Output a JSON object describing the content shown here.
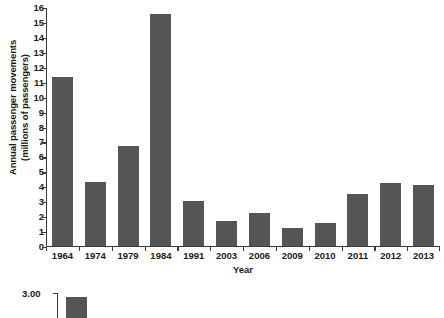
{
  "chart_data": {
    "type": "bar",
    "title": "",
    "xlabel": "Year",
    "ylabel": "Annual passenger movements\n(millions of passengers)",
    "categories": [
      "1964",
      "1974",
      "1979",
      "1984",
      "1991",
      "2003",
      "2006",
      "2009",
      "2010",
      "2011",
      "2012",
      "2013"
    ],
    "values": [
      11.3,
      4.3,
      6.7,
      15.5,
      3.0,
      1.65,
      2.2,
      1.2,
      1.5,
      3.5,
      4.2,
      4.1
    ],
    "ylim": [
      0,
      16
    ],
    "ytick_values": [
      0,
      1,
      2,
      3,
      4,
      5,
      6,
      7,
      8,
      9,
      10,
      11,
      12,
      13,
      14,
      15,
      16
    ],
    "ytick_labels": [
      "0",
      "1",
      "2",
      "3",
      "4",
      "5",
      "6",
      "7",
      "8",
      "9",
      "10",
      "11",
      "12",
      "13",
      "14",
      "15",
      "16"
    ],
    "grid": false,
    "legend": false,
    "bar_color": "#555555",
    "axis_color": "#3a3a3a"
  },
  "secondary_chart_partial": {
    "ytick_label": "3.00",
    "note": "cropped chart at bottom edge"
  }
}
